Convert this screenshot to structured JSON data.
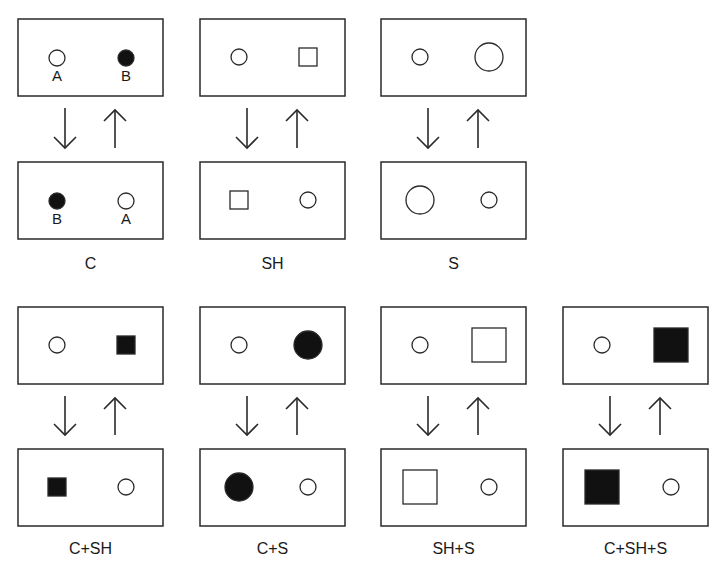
{
  "figure": {
    "panels": [
      {
        "id": "C",
        "label": "C",
        "col": 0,
        "row": 0,
        "top": {
          "left": {
            "shape": "circle",
            "fill": "white",
            "size": "small",
            "text": "A"
          },
          "right": {
            "shape": "circle",
            "fill": "black",
            "size": "small",
            "text": "B"
          }
        },
        "bottom": {
          "left": {
            "shape": "circle",
            "fill": "black",
            "size": "small",
            "text": "B"
          },
          "right": {
            "shape": "circle",
            "fill": "white",
            "size": "small",
            "text": "A"
          }
        }
      },
      {
        "id": "SH",
        "label": "SH",
        "col": 1,
        "row": 0,
        "top": {
          "left": {
            "shape": "circle",
            "fill": "white",
            "size": "small"
          },
          "right": {
            "shape": "square",
            "fill": "white",
            "size": "small"
          }
        },
        "bottom": {
          "left": {
            "shape": "square",
            "fill": "white",
            "size": "small"
          },
          "right": {
            "shape": "circle",
            "fill": "white",
            "size": "small"
          }
        }
      },
      {
        "id": "S",
        "label": "S",
        "col": 2,
        "row": 0,
        "top": {
          "left": {
            "shape": "circle",
            "fill": "white",
            "size": "small"
          },
          "right": {
            "shape": "circle",
            "fill": "white",
            "size": "large"
          }
        },
        "bottom": {
          "left": {
            "shape": "circle",
            "fill": "white",
            "size": "large"
          },
          "right": {
            "shape": "circle",
            "fill": "white",
            "size": "small"
          }
        }
      },
      {
        "id": "C+SH",
        "label": "C+SH",
        "col": 0,
        "row": 1,
        "top": {
          "left": {
            "shape": "circle",
            "fill": "white",
            "size": "small"
          },
          "right": {
            "shape": "square",
            "fill": "black",
            "size": "small"
          }
        },
        "bottom": {
          "left": {
            "shape": "square",
            "fill": "black",
            "size": "small"
          },
          "right": {
            "shape": "circle",
            "fill": "white",
            "size": "small"
          }
        }
      },
      {
        "id": "C+S",
        "label": "C+S",
        "col": 1,
        "row": 1,
        "top": {
          "left": {
            "shape": "circle",
            "fill": "white",
            "size": "small"
          },
          "right": {
            "shape": "circle",
            "fill": "black",
            "size": "large"
          }
        },
        "bottom": {
          "left": {
            "shape": "circle",
            "fill": "black",
            "size": "large"
          },
          "right": {
            "shape": "circle",
            "fill": "white",
            "size": "small"
          }
        }
      },
      {
        "id": "SH+S",
        "label": "SH+S",
        "col": 2,
        "row": 1,
        "top": {
          "left": {
            "shape": "circle",
            "fill": "white",
            "size": "small"
          },
          "right": {
            "shape": "square",
            "fill": "white",
            "size": "large"
          }
        },
        "bottom": {
          "left": {
            "shape": "square",
            "fill": "white",
            "size": "large"
          },
          "right": {
            "shape": "circle",
            "fill": "white",
            "size": "small"
          }
        }
      },
      {
        "id": "C+SH+S",
        "label": "C+SH+S",
        "col": 3,
        "row": 1,
        "top": {
          "left": {
            "shape": "circle",
            "fill": "white",
            "size": "small"
          },
          "right": {
            "shape": "square",
            "fill": "black",
            "size": "large"
          }
        },
        "bottom": {
          "left": {
            "shape": "square",
            "fill": "black",
            "size": "large"
          },
          "right": {
            "shape": "circle",
            "fill": "white",
            "size": "small"
          }
        }
      }
    ],
    "arrows": {
      "down": "↓",
      "up": "↑"
    },
    "colors": {
      "stroke": "#2a2a2a",
      "fill_black": "#111111",
      "background": "#ffffff"
    }
  }
}
